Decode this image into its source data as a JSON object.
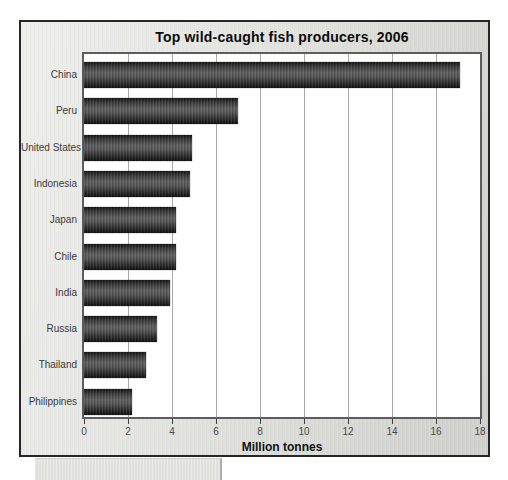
{
  "figure": {
    "border_color": "#262626",
    "panel_bg_from": "#eeeeec",
    "panel_bg_to": "#cfcfcc"
  },
  "chart_data": {
    "type": "bar",
    "orientation": "horizontal",
    "title": "Top wild-caught fish producers, 2006",
    "xlabel": "Million tonnes",
    "ylabel": "",
    "categories": [
      "China",
      "Peru",
      "United States",
      "Indonesia",
      "Japan",
      "Chile",
      "India",
      "Russia",
      "Thailand",
      "Philippines"
    ],
    "values": [
      17.1,
      7.0,
      4.9,
      4.8,
      4.2,
      4.2,
      3.9,
      3.3,
      2.8,
      2.2
    ],
    "xlim": [
      0,
      18
    ],
    "xticks": [
      0,
      2,
      4,
      6,
      8,
      10,
      12,
      14,
      16,
      18
    ],
    "grid": true,
    "legend": false,
    "plot_bg": "#fefefe",
    "gridline_color": "#a9a9a9",
    "plot_border_color": "#5d5d5d",
    "bar_color_dark": "#151515",
    "bar_color_light": "#606060",
    "tick_label_color": "#4a4a4a",
    "category_label_color": "#3a3a3a"
  }
}
